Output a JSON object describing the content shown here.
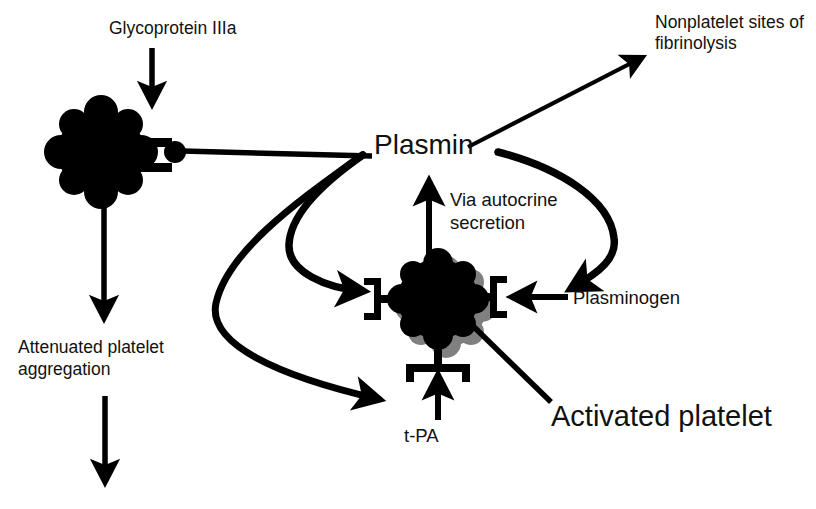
{
  "figure": {
    "type": "biological-pathway-diagram",
    "background_color": "#ffffff",
    "ink_color": "#000000",
    "shadow_color": "#808080"
  },
  "labels": {
    "glycoprotein": "Glycoprotein IIIa",
    "nonplatelet_line1": "Nonplatelet sites of",
    "nonplatelet_line2": "fibrinolysis",
    "plasmin": "Plasmin",
    "via_autocrine_line1": "Via autocrine",
    "via_autocrine_line2": "secretion",
    "plasminogen": "Plasminogen",
    "attenuated_line1": "Attenuated platelet",
    "attenuated_line2": "aggregation",
    "tpa": "t-PA",
    "activated_platelet": "Activated platelet"
  },
  "nodes": [
    {
      "id": "resting-platelet",
      "label": "",
      "shape": "lobed-blob",
      "center": [
        101,
        152
      ],
      "radius": 44,
      "fill": "#000000",
      "receptors": [
        "right-fork"
      ]
    },
    {
      "id": "activated-platelet",
      "label": "Activated platelet",
      "shape": "lobed-blob-with-shadow",
      "center": [
        438,
        299
      ],
      "radius": 41,
      "fill": "#000000",
      "shadow": "#808080",
      "receptors": [
        "left-bracket",
        "right-bracket",
        "bottom-bracket"
      ]
    },
    {
      "id": "plasmin-node",
      "label": "Plasmin",
      "shape": "text-hub",
      "center": [
        430,
        146
      ]
    },
    {
      "id": "bound-plasmin-ball",
      "label": "",
      "shape": "circle",
      "center": [
        175,
        152
      ],
      "radius": 11,
      "fill": "#000000"
    }
  ],
  "edges": [
    {
      "id": "glycoprotein-to-platelet",
      "from": "Glycoprotein IIIa",
      "to": "resting-platelet",
      "style": "straight-arrow",
      "direction": "down"
    },
    {
      "id": "platelet-receptor-to-plasmin",
      "from": "resting-platelet receptor",
      "to": "Plasmin",
      "style": "plain-line",
      "direction": "right"
    },
    {
      "id": "plasmin-to-nonplatelet",
      "from": "Plasmin",
      "to": "Nonplatelet sites of fibrinolysis",
      "style": "straight-arrow",
      "direction": "up-right"
    },
    {
      "id": "plasmin-to-activated-receptor",
      "from": "Plasmin",
      "to": "activated-platelet left receptor",
      "style": "curved-arrow",
      "direction": "down-left-then-right"
    },
    {
      "id": "plasmin-to-tpa-receptor",
      "from": "Plasmin",
      "to": "t-PA receptor",
      "style": "curved-arrow",
      "direction": "down-left-then-right"
    },
    {
      "id": "plasmin-to-plasminogen",
      "from": "Plasmin",
      "to": "Plasminogen receptor",
      "style": "curved-arrow",
      "direction": "right-then-down-left"
    },
    {
      "id": "autocrine-secretion",
      "from": "activated-platelet",
      "to": "Plasmin",
      "style": "straight-arrow",
      "direction": "up",
      "annotation": "Via autocrine secretion"
    },
    {
      "id": "plasminogen-to-receptor",
      "from": "Plasminogen",
      "to": "activated-platelet right receptor",
      "style": "straight-arrow",
      "direction": "left"
    },
    {
      "id": "tpa-to-receptor",
      "from": "t-PA",
      "to": "activated-platelet bottom receptor",
      "style": "straight-arrow",
      "direction": "up"
    },
    {
      "id": "platelet-to-attenuated",
      "from": "resting-platelet",
      "to": "Attenuated platelet aggregation",
      "style": "straight-arrow",
      "direction": "down"
    },
    {
      "id": "attenuated-downstream",
      "from": "Attenuated platelet aggregation",
      "to": "",
      "style": "straight-arrow",
      "direction": "down"
    },
    {
      "id": "activated-platelet-leader",
      "from": "Activated platelet",
      "to": "activated-platelet",
      "style": "leader-line",
      "direction": "up-left"
    }
  ]
}
